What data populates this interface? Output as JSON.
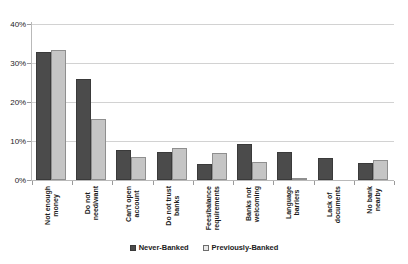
{
  "chart_data": {
    "type": "bar",
    "title": "",
    "subtitle": "",
    "xlabel": "",
    "ylabel": "",
    "ylim": [
      0,
      40
    ],
    "y_tick_labels": [
      "0%",
      "10%",
      "20%",
      "30%",
      "40%"
    ],
    "y_ticks": [
      0,
      10,
      20,
      30,
      40
    ],
    "grid": true,
    "grid_axis": "y",
    "legend_position": "bottom-center",
    "value_unit": "%",
    "categories": [
      "Not enough money",
      "Do not need/want",
      "Can't open account",
      "Do not trust banks",
      "Fees/balance requirements",
      "Banks not welcoming",
      "Language barriers",
      "Lack of documents",
      "No bank nearby"
    ],
    "category_lines": [
      [
        "Not enough",
        "money"
      ],
      [
        "Do not",
        "need/want"
      ],
      [
        "Can't open",
        "account"
      ],
      [
        "Do not trust",
        "banks"
      ],
      [
        "Fees/balance",
        "requirements"
      ],
      [
        "Banks not",
        "welcoming"
      ],
      [
        "Language",
        "barriers"
      ],
      [
        "Lack of",
        "documents"
      ],
      [
        "No bank",
        "nearby"
      ]
    ],
    "series": [
      {
        "name": "Never-Banked",
        "color": "#4b4b4b",
        "values": [
          32.7,
          26.0,
          7.6,
          7.1,
          4.2,
          9.3,
          7.2,
          5.7,
          4.3
        ]
      },
      {
        "name": "Previously-Banked",
        "color": "#c5c5c5",
        "values": [
          33.3,
          15.7,
          5.8,
          8.2,
          6.8,
          4.6,
          0.3,
          0.0,
          5.1
        ]
      }
    ]
  },
  "legend": {
    "items": [
      {
        "label": "Never-Banked",
        "swatch": "dark-gray-swatch"
      },
      {
        "label": "Previously-Banked",
        "swatch": "light-gray-swatch"
      }
    ]
  }
}
